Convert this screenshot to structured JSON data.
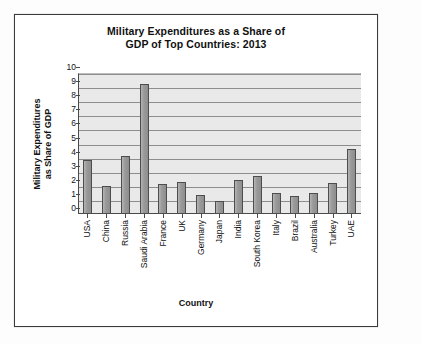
{
  "chart_data": {
    "type": "bar",
    "title": "Military Expenditures as a Share of GDP of Top Countries: 2013",
    "title_line1": "Military Expenditures as a Share of",
    "title_line2": "GDP of Top Countries: 2013",
    "xlabel": "Country",
    "ylabel": "Military Expenditures as Share of GDP",
    "ylabel_line1": "Military Expenditures",
    "ylabel_line2": "as Share of GDP",
    "ylim": [
      0,
      10
    ],
    "ytick_step": 1,
    "yticks": [
      "10",
      "9",
      "8",
      "7",
      "6",
      "5",
      "4",
      "3",
      "2",
      "1",
      "0"
    ],
    "grid": true,
    "legend": "none",
    "categories": [
      "USA",
      "China",
      "Russia",
      "Saudi Arabia",
      "France",
      "UK",
      "Germany",
      "Japan",
      "India",
      "South Korea",
      "Italy",
      "Brazil",
      "Australia",
      "Turkey",
      "UAE"
    ],
    "values": [
      3.8,
      2.0,
      4.1,
      9.25,
      2.1,
      2.25,
      1.35,
      0.95,
      2.4,
      2.7,
      1.5,
      1.3,
      1.5,
      2.2,
      4.6
    ],
    "bar_color": "#9b9b9b",
    "bar_edge_color": "#4d4d4d",
    "plot_background": "#e9e9e9",
    "gridline_color": "#8d8d8d"
  }
}
